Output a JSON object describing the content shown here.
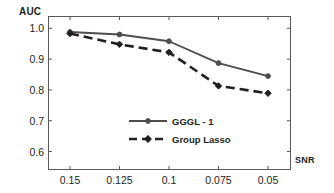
{
  "chart_data": {
    "type": "line",
    "title": "",
    "xlabel": "SNR",
    "ylabel": "AUC",
    "categories": [
      "0.15",
      "0.125",
      "0.1",
      "0.075",
      "0.05"
    ],
    "x_tick_labels": [
      "0.15",
      "0.125",
      "0.1",
      "0.075",
      "0.05"
    ],
    "y_tick_labels": [
      "1.0",
      "0.9",
      "0.8",
      "0.7",
      "0.6"
    ],
    "y_tick_values": [
      1.0,
      0.9,
      0.8,
      0.7,
      0.6
    ],
    "ylim": [
      0.54,
      1.04
    ],
    "grid": false,
    "legend_position": "center-bottom-inside",
    "series": [
      {
        "name": "GGGL - 1",
        "values": [
          0.988,
          0.98,
          0.958,
          0.887,
          0.845
        ],
        "line_style": "solid",
        "color": "#4d4d4f",
        "marker": "circle"
      },
      {
        "name": "Group Lasso",
        "values": [
          0.983,
          0.948,
          0.922,
          0.813,
          0.789
        ],
        "line_style": "dashed",
        "color": "#231f20",
        "marker": "diamond"
      }
    ]
  },
  "axes": {
    "y_title": "AUC",
    "x_title": "SNR"
  },
  "legend": {
    "items": [
      {
        "label": "GGGL - 1",
        "style": "solid"
      },
      {
        "label": "Group Lasso",
        "style": "dashed"
      }
    ]
  },
  "colors": {
    "frame": "#58595b",
    "series_1": "#4d4d4f",
    "series_2": "#231f20",
    "text": "#231f20",
    "background": "#ffffff"
  }
}
